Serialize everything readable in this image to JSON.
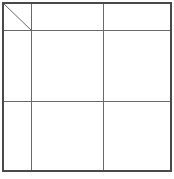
{
  "table": {
    "rows": 3,
    "columns": 3,
    "corner_cell": {
      "type": "diagonal-split",
      "top_right_label": "",
      "bottom_left_label": ""
    },
    "column_headers": [
      "",
      ""
    ],
    "row_headers": [
      "",
      ""
    ],
    "cells": [
      [
        "",
        ""
      ],
      [
        "",
        ""
      ]
    ],
    "colors": {
      "outer_border": "#4a4a4a",
      "inner_lines": "#6a6a6a",
      "background": "#ffffff"
    }
  }
}
